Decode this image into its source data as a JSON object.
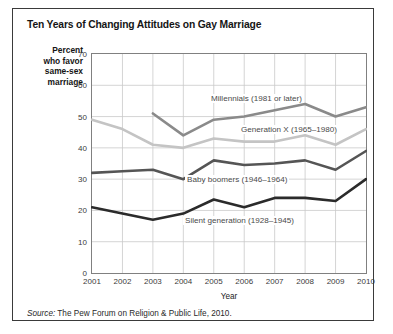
{
  "title": "Ten Years of Changing Attitudes on Gay Marriage",
  "ylabel_lines": [
    "Percent",
    "who favor",
    "same-sex",
    "marriage"
  ],
  "xaxis_title": "Year",
  "source": {
    "prefix": "Source:",
    "text": "The Pew Forum on Religion & Public Life, 2010."
  },
  "colors": {
    "millennials": "#8a8a8a",
    "generation_x": "#c4c4c4",
    "baby_boomers": "#555555",
    "silent_generation": "#2b2b2b",
    "grid": "#c9c9c9",
    "frame": "#808080",
    "border": "#3a3a3a",
    "text": "#232323"
  },
  "series_labels": {
    "millennials": "Millennials (1981 or later)",
    "generation_x": "Generation X (1965–1980)",
    "baby_boomers": "Baby boomers (1946–1964)",
    "silent_generation": "Silent generation (1928–1945)"
  },
  "chart_data": {
    "type": "line",
    "title": "Ten Years of Changing Attitudes on Gay Marriage",
    "xlabel": "Year",
    "ylabel": "Percent who favor same-sex marriage",
    "x": [
      2001,
      2002,
      2003,
      2004,
      2005,
      2006,
      2007,
      2008,
      2009,
      2010
    ],
    "xlim": [
      2001,
      2010
    ],
    "ylim": [
      0,
      70
    ],
    "ytick_labels": [
      "0",
      "10",
      "20",
      "30",
      "40",
      "50",
      "60",
      "70"
    ],
    "yticks": [
      0,
      10,
      20,
      30,
      40,
      50,
      60,
      70
    ],
    "xtick_labels": [
      "2001",
      "2002",
      "2003",
      "2004",
      "2005",
      "2006",
      "2007",
      "2008",
      "2009",
      "2010"
    ],
    "grid": true,
    "legend": "inline-labels",
    "series": [
      {
        "name": "Millennials (1981 or later)",
        "color": "#8a8a8a",
        "x": [
          2003,
          2004,
          2005,
          2006,
          2007,
          2008,
          2009,
          2010
        ],
        "values": [
          51,
          44,
          49,
          50,
          52,
          54,
          50,
          53
        ]
      },
      {
        "name": "Generation X (1965–1980)",
        "color": "#c4c4c4",
        "x": [
          2001,
          2002,
          2003,
          2004,
          2005,
          2006,
          2007,
          2008,
          2009,
          2010
        ],
        "values": [
          49,
          46,
          41,
          40,
          43,
          42,
          42,
          44,
          41,
          46
        ]
      },
      {
        "name": "Baby boomers (1946–1964)",
        "color": "#555555",
        "x": [
          2001,
          2002,
          2003,
          2004,
          2005,
          2006,
          2007,
          2008,
          2009,
          2010
        ],
        "values": [
          32,
          32.5,
          33,
          30,
          36,
          34.5,
          35,
          36,
          33,
          39
        ]
      },
      {
        "name": "Silent generation (1928–1945)",
        "color": "#2b2b2b",
        "x": [
          2001,
          2002,
          2003,
          2004,
          2005,
          2006,
          2007,
          2008,
          2009,
          2010
        ],
        "values": [
          21,
          19,
          17,
          19,
          23.5,
          21,
          24,
          24,
          23,
          30
        ]
      }
    ]
  }
}
